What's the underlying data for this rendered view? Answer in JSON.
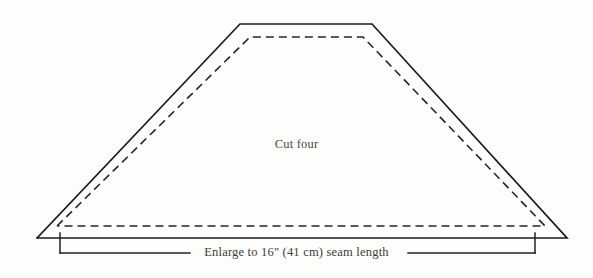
{
  "figure": {
    "background_color": "#fdfdfb",
    "line_color": "#1b1b1b",
    "cut_four_label": "Cut four",
    "dimension_caption": "Enlarge to 16\" (41 cm) seam length"
  },
  "geometry": {
    "cut_line_label": "cutting line (solid outline)",
    "seam_line_label": "seam line (dashed inner outline)",
    "cut_outline_points": "37,238 240,24 372,24 567,238",
    "seam_outline_points": "57,226 250,37 363,37 545,226",
    "dimension_bracket": {
      "left_tick_x": 60,
      "right_tick_x": 535,
      "top_y": 233,
      "bottom_y": 253,
      "left_leader_end_x": 190,
      "right_leader_start_x": 408
    }
  },
  "measurements": {
    "seam_length_inches": "16\"",
    "seam_length_cm": "41 cm",
    "pieces_to_cut": "four"
  }
}
